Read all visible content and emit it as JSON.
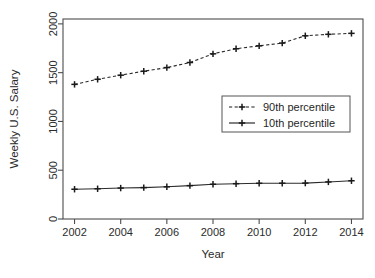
{
  "chart_data": {
    "type": "line",
    "title": "",
    "xlabel": "Year",
    "ylabel": "Weekly U.S. Salary",
    "x": [
      2002,
      2003,
      2004,
      2005,
      2006,
      2007,
      2008,
      2009,
      2010,
      2011,
      2012,
      2013,
      2014
    ],
    "xlim": [
      2001.5,
      2014.5
    ],
    "ylim": [
      0,
      2050
    ],
    "xticks": [
      2002,
      2004,
      2006,
      2008,
      2010,
      2012,
      2014
    ],
    "xtick_labels": [
      "2002",
      "2004",
      "2006",
      "2008",
      "2010",
      "2012",
      "2014"
    ],
    "yticks": [
      0,
      500,
      1000,
      1500,
      2000
    ],
    "ytick_labels": [
      "0",
      "500",
      "1000",
      "1500",
      "2000"
    ],
    "grid": false,
    "legend_position": "center-right",
    "series": [
      {
        "name": "90th percentile",
        "style": "dashed",
        "marker": "plus",
        "color": "#1a1a1a",
        "values": [
          1380,
          1432,
          1474,
          1515,
          1552,
          1604,
          1693,
          1745,
          1775,
          1803,
          1878,
          1893,
          1903
        ]
      },
      {
        "name": "10th percentile",
        "style": "solid",
        "marker": "plus",
        "color": "#1a1a1a",
        "values": [
          305,
          310,
          317,
          322,
          330,
          342,
          356,
          362,
          366,
          367,
          368,
          380,
          392
        ]
      }
    ]
  },
  "legend": {
    "entries": [
      {
        "label": "90th percentile"
      },
      {
        "label": "10th percentile"
      }
    ]
  }
}
